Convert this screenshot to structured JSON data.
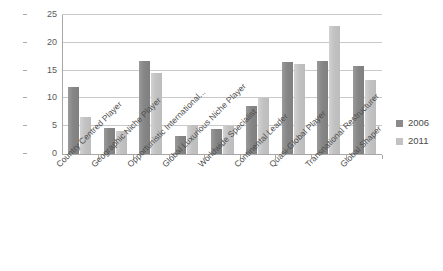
{
  "chart_data": {
    "type": "bar",
    "title": "",
    "xlabel": "",
    "ylabel": "",
    "ylim": [
      0,
      25
    ],
    "yticks": [
      0,
      5,
      10,
      15,
      20,
      25
    ],
    "grid": true,
    "legend_position": "right",
    "categories": [
      "Country Centred Player",
      "Geographic Niche Player",
      "Opportunistic International...",
      "Global Luxurious Niche Player",
      "Worldwide Specialist",
      "Continental Leader",
      "Quasi-Global Player",
      "Transnational Restructurer",
      "Global Shaper"
    ],
    "series": [
      {
        "name": "2006",
        "color": "#8a8a8a",
        "values": [
          12.0,
          4.7,
          16.7,
          3.3,
          4.5,
          8.6,
          16.6,
          16.7,
          15.9
        ]
      },
      {
        "name": "2011",
        "color": "#c2c2c2",
        "values": [
          6.7,
          4.2,
          14.6,
          5.2,
          5.1,
          10.1,
          16.1,
          23.0,
          13.4
        ]
      }
    ]
  }
}
